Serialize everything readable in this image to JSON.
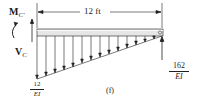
{
  "figure": {
    "label": "(f)",
    "span_dimension": "12 ft",
    "moment_label": {
      "main": "M",
      "sub": "C'"
    },
    "shear_label": {
      "main": "V",
      "sub": "C"
    },
    "left_load": {
      "numerator": "12",
      "denominator": "EI"
    },
    "right_reaction": {
      "numerator": "162",
      "denominator": "EI"
    },
    "colors": {
      "ink": "#231f20",
      "beam_fill": "#e6e6e6"
    },
    "load_arrow_count": 14,
    "load_shape": "linearly varying (triangular) distributed load, max at left, zero at right"
  }
}
